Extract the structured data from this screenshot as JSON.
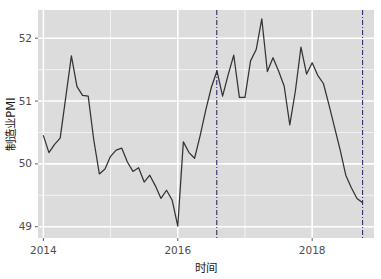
{
  "chart_data": {
    "type": "line",
    "title": "",
    "xlabel": "时间",
    "ylabel": "制造业PMI",
    "xlim": [
      2013.92,
      2018.92
    ],
    "ylim": [
      48.82,
      52.45
    ],
    "grid": true,
    "legend": null,
    "x_ticks": [
      2014,
      2016,
      2018
    ],
    "x_tick_labels": [
      "2014",
      "2016",
      "2018"
    ],
    "y_ticks": [
      49,
      50,
      51,
      52
    ],
    "y_tick_labels": [
      "49",
      "50",
      "51",
      "52"
    ],
    "y_minor_ticks": [
      49.5,
      50.5,
      51.5
    ],
    "line_color": "#333333",
    "panel_color": "#dcdcdc",
    "grid_color": "#ffffff",
    "annotations": [
      {
        "type": "vline",
        "x": 2016.58,
        "style": "dashdot",
        "color": "#2f2f6b"
      },
      {
        "type": "vline",
        "x": 2018.75,
        "style": "dashdot",
        "color": "#2f2f6b"
      }
    ],
    "series": [
      {
        "name": "制造业PMI",
        "x": [
          2014.0,
          2014.083,
          2014.167,
          2014.25,
          2014.333,
          2014.417,
          2014.5,
          2014.583,
          2014.667,
          2014.75,
          2014.833,
          2014.917,
          2015.0,
          2015.083,
          2015.167,
          2015.25,
          2015.333,
          2015.417,
          2015.5,
          2015.583,
          2015.667,
          2015.75,
          2015.833,
          2015.917,
          2016.0,
          2016.083,
          2016.167,
          2016.25,
          2016.333,
          2016.417,
          2016.5,
          2016.583,
          2016.667,
          2016.75,
          2016.833,
          2016.917,
          2017.0,
          2017.083,
          2017.167,
          2017.25,
          2017.333,
          2017.417,
          2017.5,
          2017.583,
          2017.667,
          2017.75,
          2017.833,
          2017.917,
          2018.0,
          2018.083,
          2018.167,
          2018.25,
          2018.333,
          2018.417,
          2018.5,
          2018.583,
          2018.667,
          2018.75
        ],
        "values": [
          50.45,
          50.18,
          50.31,
          50.41,
          51.06,
          51.72,
          51.23,
          51.09,
          51.08,
          50.38,
          49.84,
          49.92,
          50.12,
          50.22,
          50.25,
          50.03,
          49.88,
          49.94,
          49.71,
          49.82,
          49.65,
          49.45,
          49.58,
          49.42,
          49.01,
          50.35,
          50.18,
          50.09,
          50.45,
          50.86,
          51.22,
          51.48,
          51.08,
          51.42,
          51.73,
          51.06,
          51.06,
          51.64,
          51.82,
          52.31,
          51.47,
          51.69,
          51.48,
          51.24,
          50.62,
          51.16,
          51.86,
          51.43,
          51.61,
          51.41,
          51.28,
          50.94,
          50.58,
          50.22,
          49.82,
          49.62,
          49.45,
          49.38
        ]
      }
    ]
  },
  "axis": {
    "y_label": "制造业PMI",
    "x_label": "时间"
  }
}
